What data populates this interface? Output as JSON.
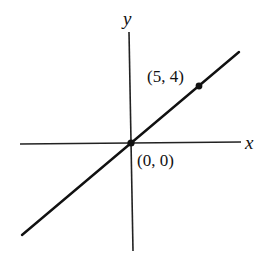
{
  "diagram": {
    "type": "cartesian-line-graph",
    "axes": {
      "x_label": "x",
      "y_label": "y"
    },
    "points": [
      {
        "label": "(0, 0)",
        "x": 0,
        "y": 0
      },
      {
        "label": "(5, 4)",
        "x": 5,
        "y": 4
      }
    ],
    "line": {
      "slope": "4/5",
      "through": [
        "(0, 0)",
        "(5, 4)"
      ]
    },
    "colors": {
      "ink": "#111111",
      "background": "#ffffff"
    }
  }
}
